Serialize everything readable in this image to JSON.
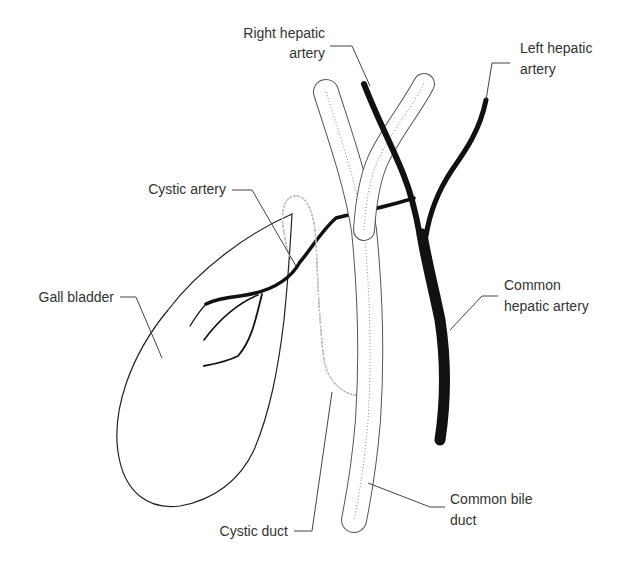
{
  "diagram": {
    "labels": {
      "right_hepatic_artery": [
        "Right hepatic",
        "artery"
      ],
      "left_hepatic_artery": [
        "Left hepatic",
        "artery"
      ],
      "cystic_artery": [
        "Cystic artery"
      ],
      "gall_bladder": [
        "Gall bladder"
      ],
      "common_hepatic_artery": [
        "Common",
        "hepatic artery"
      ],
      "cystic_duct": [
        "Cystic duct"
      ],
      "common_bile_duct": [
        "Common bile",
        "duct"
      ]
    },
    "colors": {
      "artery": "#111111",
      "duct_outline": "#555555",
      "duct_hatch": "#8a8a8a",
      "label_text": "#333333",
      "leader_line": "#444444",
      "background": "#ffffff"
    },
    "structures": [
      "gall-bladder",
      "cystic-duct",
      "common-bile-duct",
      "right-hepatic-duct",
      "left-hepatic-duct",
      "right-hepatic-artery",
      "left-hepatic-artery",
      "common-hepatic-artery",
      "cystic-artery"
    ]
  }
}
